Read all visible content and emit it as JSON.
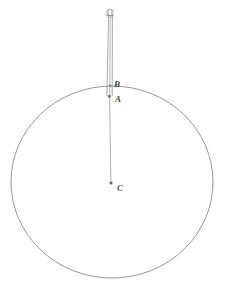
{
  "figure": {
    "background_color": "#ffffff",
    "width": 230,
    "height": 292,
    "stroke_color": "#8a8a8a",
    "label_color": "#4a4a4a"
  },
  "labels": {
    "b": "B",
    "a": "A",
    "c": "C"
  },
  "geometry": {
    "circle": {
      "name": "main-circle",
      "center_x": 112,
      "center_y": 182,
      "radius_x": 101,
      "radius_y": 96,
      "stroke_width": 0.9
    },
    "rod": {
      "name": "vertical-rod",
      "left_edge_x": 107.5,
      "right_edge_x": 112.5,
      "top_y": 15,
      "bottom_y": 96,
      "stroke_width": 0.8
    },
    "thin_line": {
      "name": "radius-segment",
      "x": 110,
      "top_y": 96,
      "bottom_y": 183,
      "stroke_width": 0.8
    },
    "top_ring": {
      "name": "rod-top-ring",
      "cx": 109.5,
      "cy": 12.5,
      "r": 3.2,
      "stroke_width": 0.9
    },
    "point_a": {
      "name": "point-a-dot",
      "cx": 109.5,
      "cy": 96,
      "r": 1.4
    },
    "point_c": {
      "name": "point-c-dot",
      "cx": 111,
      "cy": 183,
      "r": 1.4
    },
    "cap": {
      "name": "rod-top-cap",
      "x1": 106.5,
      "x2": 113.5,
      "y": 15.5,
      "stroke_width": 1.1
    }
  }
}
